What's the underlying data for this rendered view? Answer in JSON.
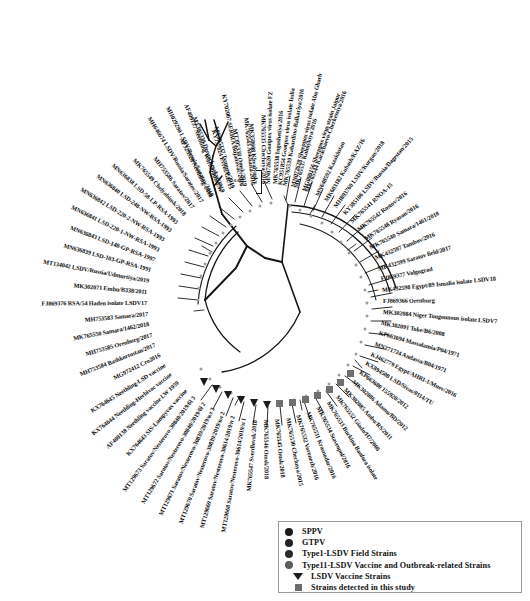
{
  "figure": {
    "type": "circular-phylogenetic-tree",
    "scale_bar_value": "0.005"
  },
  "legend": {
    "items": [
      {
        "label": "SPPV",
        "marker": "circle-icon",
        "color": "#1a1a1a"
      },
      {
        "label": "GTPV",
        "marker": "circle-icon",
        "color": "#232323"
      },
      {
        "label": "Type1-LSDV Field Strains",
        "marker": "circle-icon",
        "color": "#2b2b2b"
      },
      {
        "label": "Type11-LSDV Vaccine and Outbreak-related Strains",
        "marker": "circle-icon",
        "color": "#5c5c5c"
      },
      {
        "label": "LSDV Vaccine Strains",
        "marker": "triangle-icon",
        "color": "#1b1b1b"
      },
      {
        "label": "Strains detected in this study",
        "marker": "square-icon",
        "color": "#6b6b6b"
      }
    ]
  },
  "taxa": [
    {
      "name": "MG000156 Sheeppox virus strain Jaipur",
      "angle": -70.5,
      "r": 243,
      "group": "SPPV"
    },
    {
      "name": "MN072628 Sheeppox virus isolate Abu Gharb",
      "angle": -76.5,
      "r": 243,
      "group": "SPPV"
    },
    {
      "name": "KC951854 Goatpox virus isolate India",
      "angle": -82.5,
      "r": 243,
      "group": "GTPV"
    },
    {
      "name": "MN072620 Goatpox virus isolate FZ",
      "angle": -88.5,
      "r": 243,
      "group": "GTPV"
    },
    {
      "name": "MK358608 Khvalynsky",
      "angle": -94.5,
      "r": 243,
      "group": "Type11"
    },
    {
      "name": "MT395338 Omsk/2019",
      "angle": -100.0,
      "r": 243,
      "group": "Type11"
    },
    {
      "name": "MT395337 Tyumen/2019",
      "angle": -105.5,
      "r": 243,
      "group": "Type11"
    },
    {
      "name": "MT395339 Dergachevskyi/2019",
      "angle": -111.0,
      "r": 243,
      "group": "Type11"
    },
    {
      "name": "MH029290 LSDV/Russia/Saratov/2019",
      "angle": -116.5,
      "r": 243,
      "group": "Type11"
    },
    {
      "name": "MH646674 LSDV/Russia/Saratov/2017",
      "angle": -122.0,
      "r": 243,
      "group": "Type11"
    },
    {
      "name": "MH753586 Saratov/2017",
      "angle": -127.3,
      "r": 243,
      "group": "Type11"
    },
    {
      "name": "MK765549 Chelyabinsk/2018",
      "angle": -132.6,
      "r": 243,
      "group": "Type11"
    },
    {
      "name": "MN636838 LSD-58-LP-RSA-1993",
      "angle": -137.9,
      "r": 243,
      "group": "Type1"
    },
    {
      "name": "MN636840 LSD-248-NW-RSA-1993",
      "angle": -143.2,
      "r": 243,
      "group": "Type1"
    },
    {
      "name": "MN636842 LSD-220-2-NW-RSA-1993",
      "angle": -148.5,
      "r": 243,
      "group": "Type1"
    },
    {
      "name": "MN636841 LSD-220-1-NW-RSA-1993",
      "angle": -153.8,
      "r": 243,
      "group": "Type1"
    },
    {
      "name": "MN636843 LSD-148-GP-RSA-1997",
      "angle": -159.1,
      "r": 243,
      "group": "Type1"
    },
    {
      "name": "MN636839 LSD-103-GP-RSA-1991",
      "angle": -164.4,
      "r": 243,
      "group": "Type1"
    },
    {
      "name": "MT134042 LSDV/Russia/Udmurtiya/2019",
      "angle": -169.7,
      "r": 243,
      "group": "Type1"
    },
    {
      "name": "MK302071 Embu/B338/2011",
      "angle": -175.0,
      "r": 243,
      "group": "Type1"
    },
    {
      "name": "FJ869376 RSA/54 Haden isolate LSDV17",
      "angle": -180.3,
      "r": 243,
      "group": "Type1"
    },
    {
      "name": "MH753583 Samara/2017",
      "angle": -185.6,
      "r": 243,
      "group": "Type1"
    },
    {
      "name": "MK765550 Samara/1462/2018",
      "angle": -190.9,
      "r": 243,
      "group": "Type1"
    },
    {
      "name": "MH753585 Orenburg/2017",
      "angle": -196.2,
      "r": 243,
      "group": "Type1"
    },
    {
      "name": "MH753584 Bashkortostan/2017",
      "angle": -201.5,
      "r": 243,
      "group": "Type1"
    },
    {
      "name": "MG972412 Cro2016",
      "angle": -206.8,
      "r": 243,
      "group": "Type1"
    },
    {
      "name": "KX764645 Neethling-LSD vaccine",
      "angle": -212.1,
      "r": 243,
      "group": "Vaccine"
    },
    {
      "name": "KX764644 Neethling-Herbivac vaccine",
      "angle": -217.4,
      "r": 243,
      "group": "Vaccine"
    },
    {
      "name": "AF409138 Neethling vaccine LW 1959",
      "angle": -222.7,
      "r": 243,
      "group": "Vaccine"
    },
    {
      "name": "KX764643 SIS-Lumpyvax vaccine",
      "angle": -228.0,
      "r": 243,
      "group": "Vaccine"
    },
    {
      "name": "MT129673 Saratov/Nesterovo-30840/2019/бl 3",
      "angle": -233.3,
      "r": 243,
      "group": "Study"
    },
    {
      "name": "MT129672 Saratov/Nesterovo-30840/2019/бl 2",
      "angle": -238.6,
      "r": 243,
      "group": "Study"
    },
    {
      "name": "MT129671 Saratov/Nesterovo-30839/2019/вл 3",
      "angle": -243.9,
      "r": 243,
      "group": "Study"
    },
    {
      "name": "MT129670 Saratov/Nesterovo-30839/2019/вл 2",
      "angle": -249.2,
      "r": 243,
      "group": "Study"
    },
    {
      "name": "MT129669 Saratov/Nesterovo-30614/2019/п 2",
      "angle": -254.5,
      "r": 243,
      "group": "Study"
    },
    {
      "name": "MT129668 Saratov/Nesterovo-30614/2019/п 1",
      "angle": -259.8,
      "r": 243,
      "group": "Study"
    },
    {
      "name": "MK765547 Sverdlovsk/2018",
      "angle": -265.1,
      "r": 243,
      "group": "Study"
    },
    {
      "name": "MK765546 Omsk/2018",
      "angle": -270.4,
      "r": 243,
      "group": "Study"
    },
    {
      "name": "MK765545 Omsk/2018",
      "angle": -275.7,
      "r": 243,
      "group": "Study"
    },
    {
      "name": "MK765530 Chechnya/2015",
      "angle": -281.0,
      "r": 243,
      "group": "Type1"
    },
    {
      "name": "MK765532 Voronezh/2016",
      "angle": -286.3,
      "r": 243,
      "group": "Type1"
    },
    {
      "name": "MK765531 Krasnodar/2016",
      "angle": -291.6,
      "r": 243,
      "group": "Type1"
    },
    {
      "name": "MK765534 Stavropol/2016",
      "angle": -296.9,
      "r": 243,
      "group": "Type1"
    },
    {
      "name": "MK765533 Burkina Banfora isolate",
      "angle": -302.2,
      "r": 243,
      "group": "Type1"
    },
    {
      "name": "MK765552 Giado/H7/2008",
      "angle": -307.5,
      "r": 243,
      "group": "Type1"
    },
    {
      "name": "MK302085 Ambo/RS/2011",
      "angle": -312.8,
      "r": 243,
      "group": "Type1"
    },
    {
      "name": "MK302086 Adamu/BD/2012",
      "angle": -318.1,
      "r": 243,
      "group": "Type1"
    },
    {
      "name": "KP663680 155920/2012",
      "angle": -323.4,
      "r": 243,
      "group": "Type1"
    },
    {
      "name": "KX894508 LSD/Sivas/0114/TU",
      "angle": -328.7,
      "r": 243,
      "group": "Type1"
    },
    {
      "name": "KJ462779 Egypt/AHRI-1/Muev/2016",
      "angle": -334.0,
      "r": 243,
      "group": "Type1"
    },
    {
      "name": "MN271724 Andassa/B04/1971",
      "angle": -339.3,
      "r": 243,
      "group": "Type1"
    },
    {
      "name": "KP663694 Massalamia/P04/1971",
      "angle": -344.6,
      "r": 243,
      "group": "Type1"
    },
    {
      "name": "MK302091 Toke/B6/2008",
      "angle": -349.9,
      "r": 243,
      "group": "Type1"
    },
    {
      "name": "MK302084 Niger Tougounous isolate LSDV7",
      "angle": -355.2,
      "r": 243,
      "group": "Type1"
    },
    {
      "name": "FJ869366 Orenburg",
      "angle": -360.5,
      "r": 243,
      "group": "Type1"
    },
    {
      "name": "MK432598 Egypt/89 Ismalia isolate LSDV18",
      "angle": -365.8,
      "r": 243,
      "group": "Type1"
    },
    {
      "name": "FJ869377 Volgograd",
      "angle": -371.1,
      "r": 243,
      "group": "Type1"
    },
    {
      "name": "MK432599 Saratov field/2017",
      "angle": -376.4,
      "r": 243,
      "group": "Type1"
    },
    {
      "name": "MK432597 Tambov/2016",
      "angle": -381.7,
      "r": 243,
      "group": "Type1"
    },
    {
      "name": "MK765540 Samara/1461/2018",
      "angle": -387.0,
      "r": 243,
      "group": "Type1"
    },
    {
      "name": "MK765548 Ryazan/2016",
      "angle": -392.3,
      "r": 243,
      "group": "Type1"
    },
    {
      "name": "MK765542 Rostov/2016",
      "angle": -397.6,
      "r": 243,
      "group": "Type1"
    },
    {
      "name": "MK765541 RNOA-15",
      "angle": -402.9,
      "r": 243,
      "group": "Type1"
    },
    {
      "name": "KY385106 LSDV/Russia/Dagestan/2015",
      "angle": -408.2,
      "r": 243,
      "group": "Type1"
    },
    {
      "name": "MH893760 LSDV/Kurgan/2018",
      "angle": -413.5,
      "r": 243,
      "group": "Type1"
    },
    {
      "name": "MK603182 Kubash/KAZ/16",
      "angle": -418.8,
      "r": 243,
      "group": "Type1"
    },
    {
      "name": "MN648592 Kazakhstan",
      "angle": -424.1,
      "r": 243,
      "group": "Type1"
    },
    {
      "name": "MK765544 Karachaevo-Cherkessiya/2016",
      "angle": -429.4,
      "r": 243,
      "group": "Type1"
    },
    {
      "name": "MK765537 Kalmykiya/2016",
      "angle": -434.7,
      "r": 243,
      "group": "Type1"
    },
    {
      "name": "MK765539 Kabardino-Balkariya/2016",
      "angle": -440.0,
      "r": 243,
      "group": "Type1"
    },
    {
      "name": "MK765538 Ingushetiya/2016",
      "angle": -445.3,
      "r": 243,
      "group": "Type1"
    },
    {
      "name": "MK765535 Chechnya/2016",
      "angle": -450.6,
      "r": 243,
      "group": "Type1"
    },
    {
      "name": "MK765543 Abkhazia/2016",
      "angle": -455.9,
      "r": 243,
      "group": "Type1"
    },
    {
      "name": "KY702007 SERBIA/Bujanovac/2016",
      "angle": -461.2,
      "r": 243,
      "group": "Type1"
    },
    {
      "name": "KY757824 Evros/GR/15",
      "angle": -466.5,
      "r": 243,
      "group": "Type1"
    },
    {
      "name": "AF409137 Neethling Warmbaths LW",
      "angle": -471.8,
      "r": 243,
      "group": "Vaccine"
    },
    {
      "name": "AF325528 Neethling-2490",
      "angle": -477.1,
      "r": 243,
      "group": "Vaccine"
    }
  ]
}
